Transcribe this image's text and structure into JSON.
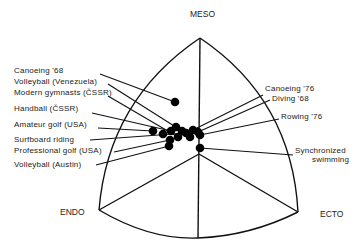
{
  "diagram": {
    "type": "somatochart",
    "axes": {
      "top": "MESO",
      "left": "ENDO",
      "right": "ECTO"
    },
    "geometry": {
      "apex": [
        200,
        38
      ],
      "endo_corner": [
        99,
        210
      ],
      "ecto_corner": [
        298,
        212
      ],
      "bottom": [
        198,
        238
      ],
      "center": [
        199,
        154
      ]
    },
    "left_labels": [
      {
        "text": "Canoeing '68",
        "x": 14,
        "y": 73,
        "line_from": [
          100,
          74
        ],
        "dot": [
          175,
          102
        ]
      },
      {
        "text": "Volleyball (Venezuela)",
        "x": 14,
        "y": 84,
        "line_from": [
          108,
          84
        ],
        "dot": [
          182,
          131
        ]
      },
      {
        "text": "Modern gymnasts (ČSSR)",
        "x": 14,
        "y": 95,
        "line_from": [
          108,
          96
        ],
        "dot": [
          178,
          137
        ]
      },
      {
        "text": "Handball (ČSSR)",
        "x": 14,
        "y": 111,
        "line_from": [
          92,
          113
        ],
        "dot": [
          171,
          131
        ]
      },
      {
        "text": "Amateur golf (USA)",
        "x": 14,
        "y": 127,
        "line_from": [
          98,
          128
        ],
        "dot": [
          153,
          131
        ]
      },
      {
        "text": "Surfboard riding",
        "x": 14,
        "y": 142,
        "line_from": [
          90,
          140
        ],
        "dot": [
          186,
          133
        ]
      },
      {
        "text": "Professional golf (USA)",
        "x": 14,
        "y": 153,
        "line_from": [
          114,
          152
        ],
        "dot": [
          170,
          140
        ]
      },
      {
        "text": "Volleyball (Austin)",
        "x": 14,
        "y": 167,
        "line_from": [
          96,
          165
        ],
        "dot": [
          169,
          146
        ]
      }
    ],
    "right_labels": [
      {
        "text": "Canoeing '76",
        "x": 265,
        "y": 91,
        "line_from": [
          263,
          95
        ],
        "dot": [
          193,
          130
        ]
      },
      {
        "text": "Diving '68",
        "x": 272,
        "y": 101,
        "line_from": [
          270,
          100
        ],
        "dot": [
          198,
          132
        ]
      },
      {
        "text": "Rowing '76",
        "x": 281,
        "y": 119,
        "line_from": [
          279,
          119
        ],
        "dot": [
          200,
          135
        ]
      },
      {
        "text": "Synchronized",
        "x": 295,
        "y": 153,
        "line_from": [
          293,
          155
        ],
        "dot": [
          200,
          148
        ]
      },
      {
        "text": "swimming",
        "x": 312,
        "y": 162
      }
    ],
    "extra_dots": [
      [
        163,
        134
      ],
      [
        190,
        137
      ],
      [
        176,
        127
      ]
    ]
  }
}
